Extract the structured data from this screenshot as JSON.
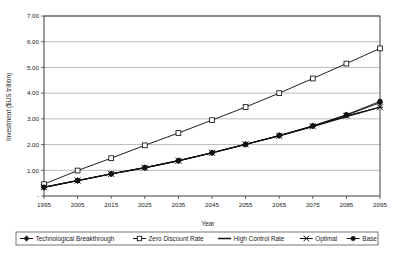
{
  "chart_data": {
    "type": "line",
    "title": "",
    "xlabel": "Year",
    "ylabel": "Investment ($US trillion)",
    "categories": [
      1995,
      2005,
      2015,
      2025,
      2035,
      2045,
      2055,
      2065,
      2075,
      2085,
      2095
    ],
    "x_tick_labels": [
      "1995",
      "2005",
      "2015",
      "2025",
      "2035",
      "2045",
      "2055",
      "2065",
      "2075",
      "2085",
      "2095"
    ],
    "y_tick_labels": [
      "-",
      "1.00",
      "2.00",
      "3.00",
      "4.00",
      "5.00",
      "6.00",
      "7.00"
    ],
    "y_tick_values": [
      0,
      1,
      2,
      3,
      4,
      5,
      6,
      7
    ],
    "ylim": [
      0,
      7
    ],
    "grid": "horizontal",
    "legend_position": "bottom",
    "series": [
      {
        "name": "Technological Breakthrough",
        "marker": "diamond",
        "values": [
          0.34,
          0.6,
          0.86,
          1.1,
          1.37,
          1.68,
          2.01,
          2.35,
          2.72,
          3.14,
          3.63
        ]
      },
      {
        "name": "Zero Discount Rate",
        "marker": "open-square",
        "values": [
          0.46,
          0.99,
          1.47,
          1.97,
          2.45,
          2.95,
          3.46,
          4.0,
          4.57,
          5.15,
          5.74
        ]
      },
      {
        "name": "High Control Rate",
        "marker": "none",
        "values": [
          0.34,
          0.6,
          0.86,
          1.1,
          1.37,
          1.68,
          2.01,
          2.34,
          2.7,
          3.09,
          3.46
        ]
      },
      {
        "name": "Optimal",
        "marker": "asterisk",
        "values": [
          0.34,
          0.6,
          0.86,
          1.1,
          1.37,
          1.68,
          2.01,
          2.34,
          2.71,
          3.12,
          3.45
        ]
      },
      {
        "name": "Base",
        "marker": "circle",
        "values": [
          0.34,
          0.6,
          0.86,
          1.1,
          1.37,
          1.68,
          2.01,
          2.35,
          2.73,
          3.16,
          3.68
        ]
      }
    ]
  },
  "legend": {
    "items": [
      {
        "label": "Technological Breakthrough",
        "marker": "diamond"
      },
      {
        "label": "Zero Discount Rate",
        "marker": "open-square"
      },
      {
        "label": "High Control Rate",
        "marker": "none"
      },
      {
        "label": "Optimal",
        "marker": "asterisk"
      },
      {
        "label": "Base",
        "marker": "circle"
      }
    ]
  },
  "colors": {
    "series_stroke": "#121212",
    "grid": "#8d8d8d",
    "axis": "#2a2a2a",
    "background": "#ffffff"
  }
}
